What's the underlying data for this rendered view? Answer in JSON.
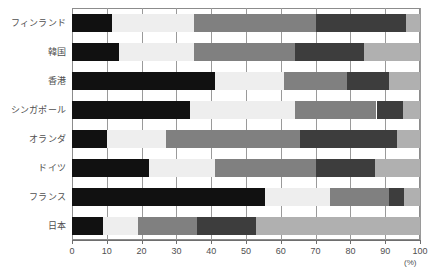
{
  "chart_data": {
    "type": "bar",
    "orientation": "horizontal",
    "stacked": true,
    "title": "",
    "subtitle": "",
    "xlabel": "(%)",
    "ylabel": "",
    "xlim": [
      0,
      100
    ],
    "xticks": [
      0,
      10,
      20,
      30,
      40,
      50,
      60,
      70,
      80,
      90,
      100
    ],
    "xticklabels": [
      "0",
      "10",
      "20",
      "30",
      "40",
      "50",
      "60",
      "70",
      "80",
      "90",
      "100"
    ],
    "grid": true,
    "grid_axis": "x",
    "legend": false,
    "legend_position": "none",
    "categories": [
      "フィンランド",
      "韓国",
      "香港",
      "シンガポール",
      "オランダ",
      "ドイツ",
      "フランス",
      "日本"
    ],
    "series": [
      {
        "name": "segment-1",
        "color": "#111111",
        "values": [
          11.5,
          13.5,
          41.0,
          34.0,
          10.0,
          22.0,
          55.5,
          9.0
        ]
      },
      {
        "name": "segment-2",
        "color": "#eeeeee",
        "values": [
          23.5,
          21.5,
          20.0,
          30.0,
          17.0,
          19.0,
          18.5,
          10.0
        ]
      },
      {
        "name": "segment-3",
        "color": "#808080",
        "values": [
          35.0,
          29.0,
          18.0,
          23.5,
          38.5,
          29.0,
          17.0,
          17.0
        ]
      },
      {
        "name": "segment-4",
        "color": "#3d3d3d",
        "values": [
          26.0,
          20.0,
          12.0,
          7.5,
          28.0,
          17.0,
          4.5,
          17.0
        ]
      },
      {
        "name": "segment-5",
        "color": "#b0b0b0",
        "values": [
          4.0,
          16.0,
          9.0,
          5.0,
          6.5,
          13.0,
          4.5,
          47.0
        ]
      }
    ],
    "cumulative_boundaries": [
      [
        11.5,
        35.0,
        70.0,
        96.0,
        100.0
      ],
      [
        13.5,
        35.0,
        64.0,
        84.0,
        100.0
      ],
      [
        41.0,
        61.0,
        79.0,
        91.0,
        100.0
      ],
      [
        34.0,
        64.0,
        87.5,
        95.0,
        100.0
      ],
      [
        10.0,
        27.0,
        65.5,
        93.5,
        100.0
      ],
      [
        22.0,
        41.0,
        70.0,
        87.0,
        100.0
      ],
      [
        55.5,
        74.0,
        91.0,
        95.5,
        100.0
      ],
      [
        9.0,
        19.0,
        36.0,
        53.0,
        100.0
      ]
    ]
  },
  "colors": {
    "segment_1": "#111111",
    "segment_2": "#eeeeee",
    "segment_3": "#808080",
    "segment_4": "#3d3d3d",
    "segment_5": "#b0b0b0",
    "frame": "#8c8c8c",
    "grid": "#9a9a9a",
    "text": "#4f4f4f",
    "background": "#ffffff"
  }
}
